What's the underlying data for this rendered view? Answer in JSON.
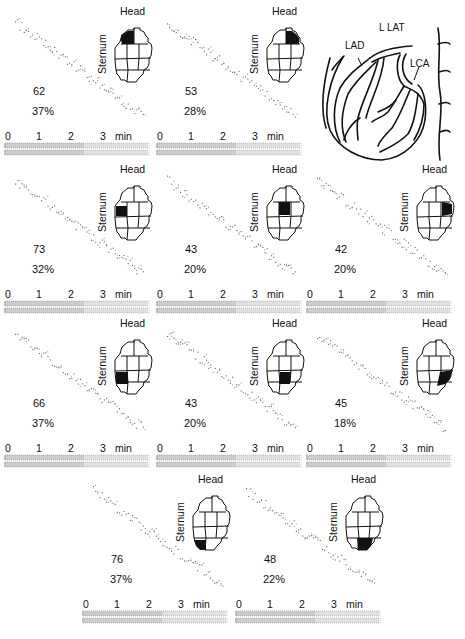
{
  "figure": {
    "head_label": "Head",
    "sternum_label": "Sternum",
    "time_axis": {
      "ticks": [
        "0",
        "1",
        "2",
        "3"
      ],
      "unit": "min"
    },
    "diagram": {
      "view_label": "L LAT",
      "labels": {
        "lad": "LAD",
        "lca": "LCA"
      }
    }
  },
  "chart_data": {
    "type": "scatter",
    "title": "",
    "xlabel": "min",
    "ylabel": "",
    "x_ticks": [
      "0",
      "1",
      "2",
      "3"
    ],
    "xlim": [
      0,
      3.6
    ],
    "panels": [
      {
        "id": 1,
        "row": 1,
        "col": 1,
        "value": "62",
        "percent": "37%",
        "highlight_segment": "upper-left"
      },
      {
        "id": 2,
        "row": 1,
        "col": 2,
        "value": "53",
        "percent": "28%",
        "highlight_segment": "upper-right"
      },
      {
        "id": 3,
        "row": 2,
        "col": 1,
        "value": "73",
        "percent": "32%",
        "highlight_segment": "mid-left"
      },
      {
        "id": 4,
        "row": 2,
        "col": 2,
        "value": "43",
        "percent": "20%",
        "highlight_segment": "mid-center"
      },
      {
        "id": 5,
        "row": 2,
        "col": 3,
        "value": "42",
        "percent": "20%",
        "highlight_segment": "mid-right"
      },
      {
        "id": 6,
        "row": 3,
        "col": 1,
        "value": "66",
        "percent": "37%",
        "highlight_segment": "lower-mid-left"
      },
      {
        "id": 7,
        "row": 3,
        "col": 2,
        "value": "43",
        "percent": "20%",
        "highlight_segment": "lower-mid-center"
      },
      {
        "id": 8,
        "row": 3,
        "col": 3,
        "value": "45",
        "percent": "18%",
        "highlight_segment": "lower-mid-right"
      },
      {
        "id": 9,
        "row": 4,
        "col": 1,
        "value": "76",
        "percent": "37%",
        "highlight_segment": "bottom-left"
      },
      {
        "id": 10,
        "row": 4,
        "col": 2,
        "value": "48",
        "percent": "22%",
        "highlight_segment": "bottom-center"
      }
    ]
  }
}
